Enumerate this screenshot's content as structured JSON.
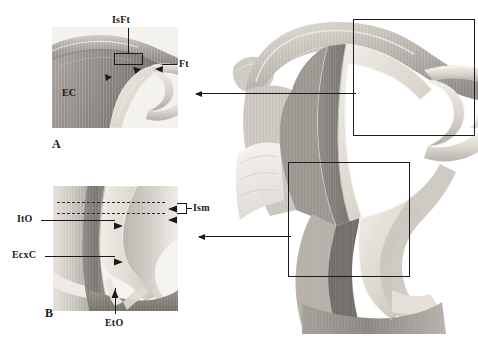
{
  "figure": {
    "kind": "anatomical-illustration",
    "background_color": "#ffffff",
    "ink_color": "#1a1a1a"
  },
  "panel_a": {
    "id": "A",
    "caption": "A",
    "labels": {
      "isft": "IsFt",
      "ft": "Ft",
      "ec": "EC"
    }
  },
  "panel_b": {
    "id": "B",
    "caption": "B",
    "labels": {
      "ism": "Ism",
      "ito": "ItO",
      "ecxc": "EcxC",
      "eto": "EtO"
    }
  },
  "main_panel": {
    "roi_top_label": "",
    "roi_bottom_label": ""
  },
  "palette": {
    "tissue_light": "#e6e2dc",
    "tissue_mid": "#b9b4ae",
    "tissue_dark": "#8d8984",
    "tissue_darker": "#6e6a66",
    "lumen": "#d8d3cb",
    "outline": "#1a1a1a",
    "roi_border": "#1c1c1c"
  }
}
